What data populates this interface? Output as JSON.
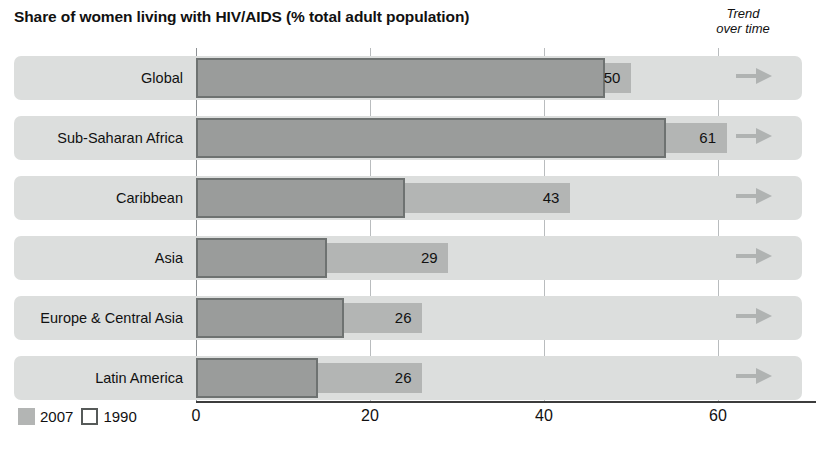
{
  "header": {
    "title": "Share of women living with HIV/AIDS (% total adult population)",
    "trend_line1": "Trend",
    "trend_line2": "over time"
  },
  "legend": {
    "items": [
      {
        "label": "2007",
        "style": "filled",
        "color": "#b3b5b4"
      },
      {
        "label": "1990",
        "style": "outline",
        "color": "#ffffff"
      }
    ]
  },
  "axis": {
    "ticks": [
      "0",
      "20",
      "40",
      "60"
    ]
  },
  "rows": [
    {
      "label": "Global",
      "value_2007": "50",
      "trend_icon": "arrow-right-icon"
    },
    {
      "label": "Sub-Saharan Africa",
      "value_2007": "61",
      "trend_icon": "arrow-right-icon"
    },
    {
      "label": "Caribbean",
      "value_2007": "43",
      "trend_icon": "arrow-right-icon"
    },
    {
      "label": "Asia",
      "value_2007": "29",
      "trend_icon": "arrow-right-icon"
    },
    {
      "label": "Europe & Central Asia",
      "value_2007": "26",
      "trend_icon": "arrow-right-icon"
    },
    {
      "label": "Latin America",
      "value_2007": "26",
      "trend_icon": "arrow-right-icon"
    }
  ],
  "chart_data": {
    "type": "bar",
    "orientation": "horizontal",
    "title": "Share of women living with HIV/AIDS (% total adult population)",
    "xlabel": "",
    "ylabel": "",
    "xlim": [
      0,
      72
    ],
    "xticks": [
      0,
      20,
      40,
      60
    ],
    "grid": true,
    "legend_position": "bottom-left",
    "categories": [
      "Global",
      "Sub-Saharan Africa",
      "Caribbean",
      "Asia",
      "Europe & Central Asia",
      "Latin America"
    ],
    "series": [
      {
        "name": "2007",
        "values": [
          50,
          61,
          43,
          29,
          26,
          26
        ]
      },
      {
        "name": "1990",
        "values": [
          47,
          54,
          24,
          15,
          17,
          14
        ]
      }
    ],
    "annotations": [
      {
        "category": "Global",
        "trend": "flat",
        "icon": "arrow-right"
      },
      {
        "category": "Sub-Saharan Africa",
        "trend": "flat",
        "icon": "arrow-right"
      },
      {
        "category": "Caribbean",
        "trend": "flat",
        "icon": "arrow-right"
      },
      {
        "category": "Asia",
        "trend": "flat",
        "icon": "arrow-right"
      },
      {
        "category": "Europe & Central Asia",
        "trend": "flat",
        "icon": "arrow-right"
      },
      {
        "category": "Latin America",
        "trend": "flat",
        "icon": "arrow-right"
      }
    ]
  },
  "geometry": {
    "x0": 196,
    "px_per_unit": 8.7,
    "row_tops": [
      56,
      116,
      176,
      236,
      296,
      356
    ],
    "gridline_units": [
      0,
      20,
      40,
      60
    ]
  },
  "colors": {
    "row_band": "#dcdedd",
    "bar_2007": "#b3b5b4",
    "bar_1990_fill": "#9a9c9b",
    "bar_1990_stroke": "#6e7271",
    "gridline": "#b9bcbe",
    "axis": "#3c3c3c",
    "arrow": "#b0b3b2"
  }
}
